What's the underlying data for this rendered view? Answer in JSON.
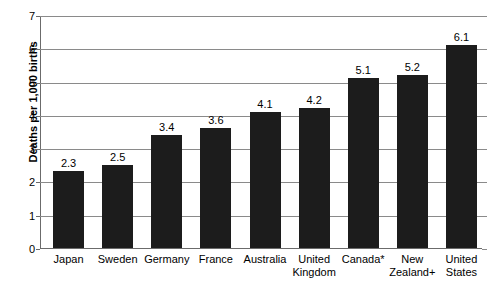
{
  "chart_data": {
    "type": "bar",
    "title": "",
    "subtitle": "",
    "xlabel": "",
    "ylabel": "Deaths per 1,000 births",
    "ylim": [
      0,
      7
    ],
    "ytick_step": 1,
    "yticks": [
      "0",
      "1",
      "2",
      "3",
      "4",
      "5",
      "6",
      "7"
    ],
    "grid": true,
    "legend": "none",
    "bar_color": "#1c1c1c",
    "gridline_color": "#8a8a8a",
    "axis_color": "#6b6b6b",
    "background_color": "#ffffff",
    "categories": [
      "Japan",
      "Sweden",
      "Germany",
      "France",
      "Australia",
      "United Kingdom",
      "Canada*",
      "New Zealand+",
      "United States"
    ],
    "category_lines": [
      [
        "Japan"
      ],
      [
        "Sweden"
      ],
      [
        "Germany"
      ],
      [
        "France"
      ],
      [
        "Australia"
      ],
      [
        "United",
        "Kingdom"
      ],
      [
        "Canada*"
      ],
      [
        "New",
        "Zealand+"
      ],
      [
        "United",
        "States"
      ]
    ],
    "values": [
      2.3,
      2.5,
      3.4,
      3.6,
      4.1,
      4.2,
      5.1,
      5.2,
      6.1
    ],
    "value_labels": [
      "2.3",
      "2.5",
      "3.4",
      "3.6",
      "4.1",
      "4.2",
      "5.1",
      "5.2",
      "6.1"
    ]
  }
}
